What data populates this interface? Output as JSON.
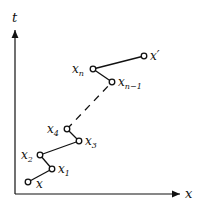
{
  "axes": {
    "x_label": "x",
    "y_label": "t"
  },
  "points": [
    {
      "id": "x",
      "label": "x",
      "sub": "",
      "cx": 28,
      "cy": 182,
      "lx": 36,
      "ly": 188
    },
    {
      "id": "x1",
      "label": "x",
      "sub": "1",
      "cx": 52,
      "cy": 169,
      "lx": 58,
      "ly": 173
    },
    {
      "id": "x2",
      "label": "x",
      "sub": "2",
      "cx": 40,
      "cy": 155,
      "lx": 21,
      "ly": 159
    },
    {
      "id": "x3",
      "label": "x",
      "sub": "3",
      "cx": 79,
      "cy": 141,
      "lx": 85,
      "ly": 145
    },
    {
      "id": "x4",
      "label": "x",
      "sub": "4",
      "cx": 67,
      "cy": 129,
      "lx": 47,
      "ly": 133
    },
    {
      "id": "xn1",
      "label": "x",
      "sub": "n−1",
      "cx": 112,
      "cy": 82,
      "lx": 118,
      "ly": 86
    },
    {
      "id": "xn",
      "label": "x",
      "sub": "n",
      "cx": 93,
      "cy": 69,
      "lx": 72,
      "ly": 73
    },
    {
      "id": "xp",
      "label": "x′",
      "sub": "",
      "cx": 144,
      "cy": 56,
      "lx": 150,
      "ly": 60
    }
  ],
  "solid_segments": [
    [
      "x",
      "x1"
    ],
    [
      "x1",
      "x2"
    ],
    [
      "x2",
      "x3"
    ],
    [
      "x3",
      "x4"
    ],
    [
      "xn1",
      "xn"
    ],
    [
      "xn",
      "xp"
    ]
  ],
  "dashed_segments": [
    [
      "x4",
      "xn1"
    ]
  ]
}
